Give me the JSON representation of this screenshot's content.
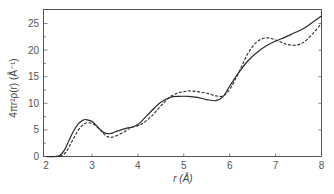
{
  "chart_data": {
    "type": "line",
    "title": "",
    "xlabel": "r (Å)",
    "ylabel": "4πr²ρ(r)  (Å⁻¹)",
    "xlim": [
      2,
      8
    ],
    "ylim": [
      0,
      27
    ],
    "xticks": [
      2,
      3,
      4,
      5,
      6,
      7,
      8
    ],
    "yticks": [
      0,
      5,
      10,
      15,
      20,
      25
    ],
    "y_minor_step": 2.5,
    "grid": false,
    "legend": null,
    "series": [
      {
        "name": "solid",
        "style": "solid",
        "x": [
          2.0,
          2.2,
          2.3,
          2.4,
          2.5,
          2.6,
          2.7,
          2.8,
          2.87,
          3.0,
          3.1,
          3.2,
          3.3,
          3.4,
          3.5,
          3.7,
          3.9,
          4.0,
          4.1,
          4.3,
          4.5,
          4.7,
          4.9,
          5.1,
          5.3,
          5.5,
          5.7,
          5.85,
          6.0,
          6.2,
          6.4,
          6.6,
          6.8,
          7.0,
          7.2,
          7.4,
          7.6,
          7.8,
          8.0
        ],
        "y": [
          0,
          0,
          0.2,
          1.2,
          3.0,
          4.8,
          6.1,
          6.8,
          6.95,
          6.6,
          5.8,
          4.9,
          4.35,
          4.3,
          4.6,
          5.2,
          5.6,
          6.0,
          6.8,
          8.6,
          10.2,
          11.1,
          11.3,
          11.3,
          11.1,
          10.7,
          10.5,
          11.2,
          13.2,
          15.8,
          18.0,
          19.6,
          20.8,
          21.7,
          22.4,
          23.2,
          24.0,
          25.2,
          26.4
        ]
      },
      {
        "name": "dashed",
        "style": "dashed",
        "x": [
          2.0,
          2.25,
          2.35,
          2.45,
          2.55,
          2.65,
          2.75,
          2.85,
          2.92,
          3.05,
          3.2,
          3.3,
          3.4,
          3.5,
          3.7,
          3.85,
          4.0,
          4.1,
          4.3,
          4.5,
          4.7,
          4.9,
          5.1,
          5.3,
          5.5,
          5.7,
          5.85,
          6.0,
          6.2,
          6.4,
          6.6,
          6.8,
          7.0,
          7.2,
          7.4,
          7.6,
          7.8,
          8.0
        ],
        "y": [
          0,
          0,
          0.2,
          1.0,
          2.6,
          4.2,
          5.5,
          6.2,
          6.35,
          6.0,
          4.8,
          3.9,
          3.6,
          3.8,
          4.6,
          5.4,
          5.8,
          6.2,
          7.6,
          9.5,
          11.2,
          12.0,
          12.3,
          12.2,
          11.9,
          11.4,
          11.4,
          12.6,
          15.8,
          19.4,
          21.6,
          22.3,
          21.9,
          21.2,
          20.9,
          21.4,
          23.0,
          25.0
        ]
      }
    ]
  }
}
